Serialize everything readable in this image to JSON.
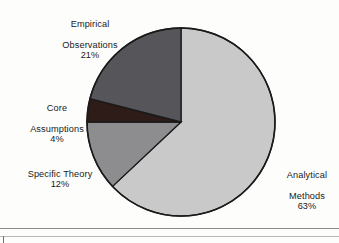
{
  "chart_data": {
    "type": "pie",
    "title": "",
    "labels": [
      "Analytical Methods",
      "Empirical Observations",
      "Specific Theory",
      "Core Assumptions"
    ],
    "values": [
      63,
      21,
      12,
      4
    ],
    "value_unit": "%",
    "total": 100,
    "start_angle_deg": 0,
    "direction": "clockwise",
    "legend": "none",
    "grid": false,
    "slices": [
      {
        "name": "Analytical Methods",
        "label_line1": "Analytical",
        "label_line2": "Methods",
        "percent_text": "63%",
        "value": 63,
        "color": "#c9c9c9",
        "edge_color": "#1a1a1a",
        "label_position": "right"
      },
      {
        "name": "Specific Theory",
        "label_line1": "Specific Theory",
        "label_line2": "",
        "percent_text": "12%",
        "value": 12,
        "color": "#8d8d90",
        "edge_color": "#1a1a1a",
        "label_position": "left-lower"
      },
      {
        "name": "Core Assumptions",
        "label_line1": "Core",
        "label_line2": "Assumptions",
        "percent_text": "4%",
        "value": 4,
        "color": "#2e1c18",
        "edge_color": "#1a1a1a",
        "label_position": "left-middle"
      },
      {
        "name": "Empirical Observations",
        "label_line1": "Empirical",
        "label_line2": "Observations",
        "percent_text": "21%",
        "value": 21,
        "color": "#55555a",
        "edge_color": "#1a1a1a",
        "label_position": "top-left"
      }
    ],
    "geometry": {
      "center_x": 181,
      "center_y": 122,
      "radius": 94
    },
    "background_color": "#fdfdfc"
  }
}
